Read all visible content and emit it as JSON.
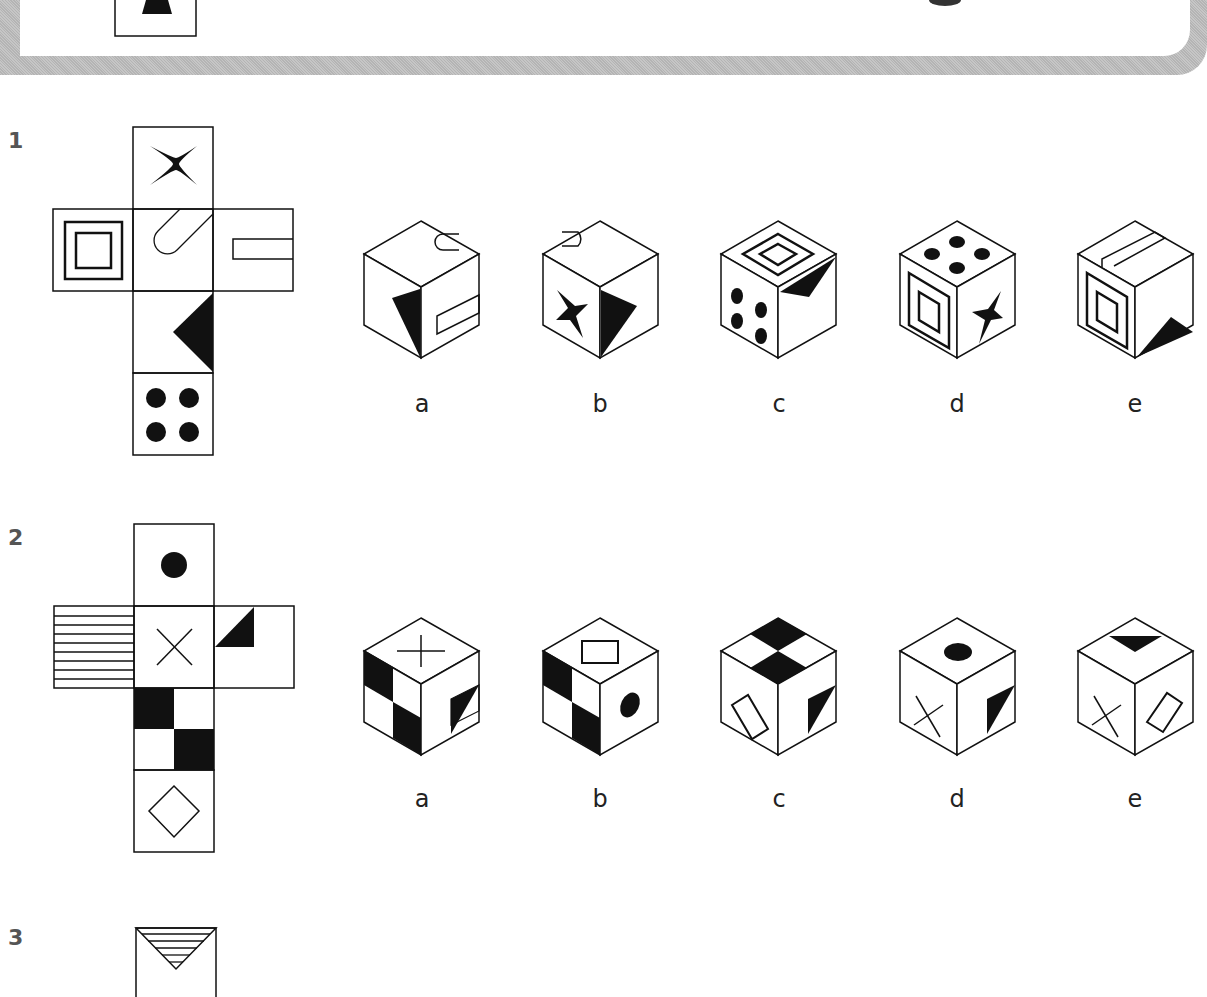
{
  "banner": {
    "partial_shape": "trapezoid",
    "has_top_right_mark": true
  },
  "questions": [
    {
      "number": "1",
      "net_faces": {
        "top": "four-point-star",
        "left": "double-square",
        "center": "paperclip-loop",
        "right": "open-rectangle",
        "below": "right-edge-triangle",
        "bottom": "four-dots"
      },
      "options": [
        {
          "label": "a",
          "top": "loop",
          "left": "triangle",
          "right": "rectangle"
        },
        {
          "label": "b",
          "top": "loop",
          "left": "star",
          "right": "triangle"
        },
        {
          "label": "c",
          "top": "double-square",
          "left": "four-dots",
          "right": "triangle"
        },
        {
          "label": "d",
          "top": "four-dots",
          "left": "double-square",
          "right": "star"
        },
        {
          "label": "e",
          "top": "rectangle",
          "left": "double-square",
          "right": "triangle"
        }
      ]
    },
    {
      "number": "2",
      "net_faces": {
        "top": "black-dot",
        "left": "horizontal-stripes",
        "center": "x-cross",
        "right": "corner-triangle",
        "below": "checkerboard",
        "bottom": "diamond"
      },
      "options": [
        {
          "label": "a",
          "top": "plus",
          "left": "checkerboard",
          "right": "triangle"
        },
        {
          "label": "b",
          "top": "rectangle",
          "left": "checkerboard",
          "right": "dot"
        },
        {
          "label": "c",
          "top": "checkerboard",
          "left": "rectangle",
          "right": "triangle"
        },
        {
          "label": "d",
          "top": "dot",
          "left": "x-cross",
          "right": "triangle"
        },
        {
          "label": "e",
          "top": "triangle",
          "left": "x-cross",
          "right": "rectangle"
        }
      ]
    },
    {
      "number": "3",
      "net_faces": {
        "top": "striped-triangle"
      }
    }
  ]
}
